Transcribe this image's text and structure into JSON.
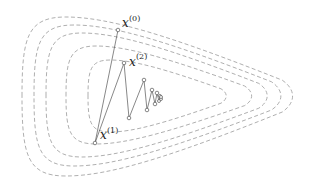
{
  "diagram": {
    "title": "",
    "colors": {
      "contour": "#9a9a9a",
      "path": "#555555",
      "point_fill": "#ffffff",
      "label": "#222222"
    },
    "labels": [
      {
        "id": "x0",
        "base": "x",
        "sup": "(0)"
      },
      {
        "id": "x1",
        "base": "x",
        "sup": "(1)"
      },
      {
        "id": "x2",
        "base": "x",
        "sup": "(2)"
      }
    ],
    "contours": [
      {
        "left": 22,
        "top": 17,
        "bottom": 176,
        "right": 296,
        "cy": 96
      },
      {
        "left": 34,
        "top": 25,
        "bottom": 166,
        "right": 284,
        "cy": 96
      },
      {
        "left": 46,
        "top": 33,
        "bottom": 157,
        "right": 270,
        "cy": 96
      },
      {
        "left": 66,
        "top": 46,
        "bottom": 144,
        "right": 254,
        "cy": 96
      },
      {
        "left": 88,
        "top": 60,
        "bottom": 132,
        "right": 228,
        "cy": 96
      }
    ],
    "iterates": [
      [
        118,
        30
      ],
      [
        95,
        143
      ],
      [
        124,
        63
      ],
      [
        129,
        118
      ],
      [
        144,
        80
      ],
      [
        147,
        110
      ],
      [
        152,
        90
      ],
      [
        155,
        104
      ],
      [
        157,
        93
      ],
      [
        159,
        101
      ],
      [
        160,
        96
      ],
      [
        161,
        99
      ],
      [
        161,
        97
      ]
    ]
  }
}
